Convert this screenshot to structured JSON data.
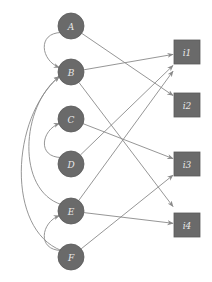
{
  "diagram": {
    "type": "bipartite-graph",
    "colors": {
      "node_fill": "#6a6a6a",
      "edge": "#8a8a8a",
      "label": "#e8e8e8",
      "background": "#ffffff"
    },
    "circle_nodes": [
      {
        "id": "A",
        "label": "A",
        "x": 71,
        "y": 26
      },
      {
        "id": "B",
        "label": "B",
        "x": 71,
        "y": 72
      },
      {
        "id": "C",
        "label": "C",
        "x": 71,
        "y": 119
      },
      {
        "id": "D",
        "label": "D",
        "x": 71,
        "y": 164
      },
      {
        "id": "E",
        "label": "E",
        "x": 71,
        "y": 211
      },
      {
        "id": "F",
        "label": "F",
        "x": 71,
        "y": 257
      }
    ],
    "square_nodes": [
      {
        "id": "i1",
        "label": "i1",
        "x": 187,
        "y": 52
      },
      {
        "id": "i2",
        "label": "i2",
        "x": 187,
        "y": 105
      },
      {
        "id": "i3",
        "label": "i3",
        "x": 187,
        "y": 164
      },
      {
        "id": "i4",
        "label": "i4",
        "x": 187,
        "y": 225
      }
    ],
    "edges": [
      {
        "from": "A",
        "to": "i2",
        "kind": "straight"
      },
      {
        "from": "B",
        "to": "i1",
        "kind": "straight"
      },
      {
        "from": "B",
        "to": "i4",
        "kind": "straight"
      },
      {
        "from": "C",
        "to": "i3",
        "kind": "straight"
      },
      {
        "from": "D",
        "to": "i1",
        "kind": "straight"
      },
      {
        "from": "E",
        "to": "i1",
        "kind": "straight"
      },
      {
        "from": "E",
        "to": "i4",
        "kind": "straight"
      },
      {
        "from": "F",
        "to": "i3",
        "kind": "straight"
      },
      {
        "from": "A",
        "to": "B",
        "kind": "curved-left"
      },
      {
        "from": "D",
        "to": "C",
        "kind": "curved-left"
      },
      {
        "from": "F",
        "to": "E",
        "kind": "curved-left"
      },
      {
        "from": "E",
        "to": "B",
        "kind": "curved-left"
      },
      {
        "from": "F",
        "to": "B",
        "kind": "curved-left"
      }
    ]
  }
}
